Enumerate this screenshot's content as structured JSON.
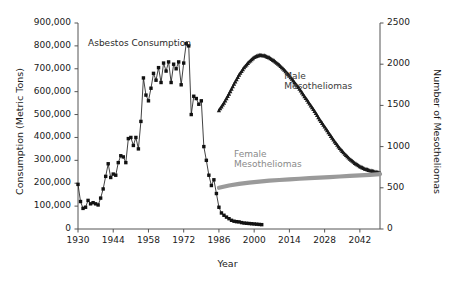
{
  "chart_data": {
    "type": "line",
    "title": "",
    "xlabel": "Year",
    "ylabel_left": "Consumption (Metric Tons)",
    "ylabel_right": "Number of Mesotheliomas",
    "xlim": [
      1930,
      2050
    ],
    "ylim_left": [
      0,
      900000
    ],
    "ylim_right": [
      0,
      2500
    ],
    "grid": false,
    "legend_position": "inline-annotations",
    "xticks": [
      1930,
      1944,
      1958,
      1972,
      1986,
      2000,
      2014,
      2028,
      2042
    ],
    "xtick_labels": [
      "1930",
      "1944",
      "1958",
      "1972",
      "1986",
      "2000",
      "2014",
      "2028",
      "2042"
    ],
    "yticks_left": [
      0,
      100000,
      200000,
      300000,
      400000,
      500000,
      600000,
      700000,
      800000,
      900000
    ],
    "ytick_labels_left": [
      "0",
      "100,000",
      "200,000",
      "300,000",
      "400,000",
      "500,000",
      "600,000",
      "700,000",
      "800,000",
      "900,000"
    ],
    "yticks_right": [
      0,
      500,
      1000,
      1500,
      2000,
      2500
    ],
    "ytick_labels_right": [
      "0",
      "500",
      "1000",
      "1500",
      "2000",
      "2500"
    ],
    "annotations": [
      {
        "name": "asbestos-consumption-label",
        "text": "Asbestos Consumption",
        "x": 1934,
        "y": 810000,
        "axis": "left",
        "color": "#2a2a2a"
      },
      {
        "name": "male-mesotheliomas-label",
        "text": "Male\nMesotheliomas",
        "x": 2012,
        "y": 1850,
        "axis": "right",
        "color": "#3a3a3a"
      },
      {
        "name": "female-mesotheliomas-label",
        "text": "Female\nMesotheliomas",
        "x": 1992,
        "y": 900,
        "axis": "right",
        "color": "#8a8a8a"
      }
    ],
    "series": [
      {
        "name": "Asbestos Consumption",
        "axis": "left",
        "marker": "square",
        "color": "#111111",
        "units": "Metric Tons",
        "x": [
          1930,
          1931,
          1932,
          1933,
          1934,
          1935,
          1936,
          1937,
          1938,
          1939,
          1940,
          1941,
          1942,
          1943,
          1944,
          1945,
          1946,
          1947,
          1948,
          1949,
          1950,
          1951,
          1952,
          1953,
          1954,
          1955,
          1956,
          1957,
          1958,
          1959,
          1960,
          1961,
          1962,
          1963,
          1964,
          1965,
          1966,
          1967,
          1968,
          1969,
          1970,
          1971,
          1972,
          1973,
          1974,
          1975,
          1976,
          1977,
          1978,
          1979,
          1980,
          1981,
          1982,
          1983,
          1984,
          1985,
          1986,
          1987,
          1988,
          1989,
          1990,
          1991,
          1992,
          1993,
          1994,
          1995,
          1996,
          1997,
          1998,
          1999,
          2000,
          2001,
          2002,
          2003
        ],
        "y": [
          195000,
          120000,
          90000,
          95000,
          125000,
          110000,
          115000,
          110000,
          105000,
          135000,
          175000,
          230000,
          285000,
          225000,
          240000,
          235000,
          290000,
          320000,
          315000,
          290000,
          395000,
          400000,
          365000,
          400000,
          350000,
          470000,
          660000,
          585000,
          560000,
          615000,
          680000,
          650000,
          705000,
          640000,
          725000,
          690000,
          730000,
          640000,
          720000,
          700000,
          730000,
          630000,
          725000,
          810000,
          800000,
          500000,
          580000,
          570000,
          545000,
          560000,
          360000,
          300000,
          235000,
          190000,
          215000,
          155000,
          95000,
          70000,
          60000,
          52000,
          45000,
          38000,
          34000,
          32000,
          31000,
          28000,
          26000,
          25000,
          24000,
          23000,
          22000,
          21000,
          20000,
          19000
        ]
      },
      {
        "name": "Male Mesotheliomas",
        "axis": "right",
        "marker": "triangle",
        "color": "#1a1a1a",
        "units": "cases per year",
        "x": [
          1986,
          1988,
          1990,
          1992,
          1994,
          1996,
          1998,
          2000,
          2002,
          2004,
          2006,
          2008,
          2010,
          2012,
          2014,
          2016,
          2018,
          2020,
          2022,
          2024,
          2026,
          2028,
          2030,
          2032,
          2034,
          2036,
          2038,
          2040,
          2042,
          2044,
          2046,
          2048,
          2050
        ],
        "y": [
          1440,
          1530,
          1640,
          1760,
          1870,
          1960,
          2030,
          2085,
          2110,
          2105,
          2080,
          2040,
          1990,
          1930,
          1860,
          1780,
          1700,
          1610,
          1520,
          1430,
          1330,
          1240,
          1150,
          1060,
          980,
          910,
          850,
          800,
          760,
          730,
          710,
          695,
          680
        ]
      },
      {
        "name": "Female Mesotheliomas",
        "axis": "right",
        "marker": "none",
        "color": "#9a9a9a",
        "units": "cases per year",
        "x": [
          1986,
          1990,
          1994,
          1998,
          2002,
          2006,
          2010,
          2014,
          2018,
          2022,
          2026,
          2030,
          2034,
          2038,
          2042,
          2046,
          2050
        ],
        "y": [
          500,
          528,
          548,
          563,
          576,
          586,
          595,
          603,
          610,
          617,
          623,
          630,
          637,
          644,
          651,
          658,
          665
        ]
      }
    ]
  }
}
